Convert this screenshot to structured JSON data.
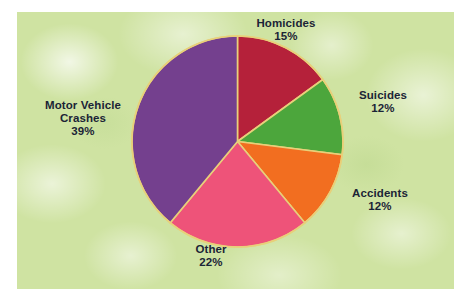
{
  "chart_data": {
    "type": "pie",
    "title": "",
    "subtitle": "",
    "xlabel": "",
    "ylabel": "",
    "legend_position": "none",
    "grid": false,
    "units": "percent",
    "total": 100,
    "categories": [
      "Homicides",
      "Suicides",
      "Accidents",
      "Other",
      "Motor Vehicle Crashes"
    ],
    "values": [
      15,
      12,
      12,
      22,
      39
    ],
    "start_angle_deg": 0,
    "direction": "clockwise",
    "slices": [
      {
        "label": "Homicides",
        "value": 15,
        "value_text": "15%",
        "color": "#b5213a",
        "start_deg": 0,
        "end_deg": 54,
        "label_position": "top-right"
      },
      {
        "label": "Suicides",
        "value": 12,
        "value_text": "12%",
        "color": "#4ca63c",
        "start_deg": 54,
        "end_deg": 97.2,
        "label_position": "right-upper"
      },
      {
        "label": "Accidents",
        "value": 12,
        "value_text": "12%",
        "color": "#f26e20",
        "start_deg": 97.2,
        "end_deg": 140.4,
        "label_position": "right-lower"
      },
      {
        "label": "Other",
        "value": 22,
        "value_text": "22%",
        "color": "#ee5379",
        "start_deg": 140.4,
        "end_deg": 219.6,
        "label_position": "bottom"
      },
      {
        "label": "Motor Vehicle Crashes",
        "value": 39,
        "value_text": "39%",
        "color": "#74408e",
        "start_deg": 219.6,
        "end_deg": 360,
        "label_position": "left"
      }
    ]
  },
  "labels": {
    "homicides": {
      "name": "Homicides",
      "pct": "15%"
    },
    "suicides": {
      "name": "Suicides",
      "pct": "12%"
    },
    "accidents": {
      "name": "Accidents",
      "pct": "12%"
    },
    "other": {
      "name": "Other",
      "pct": "22%"
    },
    "mvc": {
      "name_line1": "Motor Vehicle",
      "name_line2": "Crashes",
      "pct": "39%"
    }
  },
  "style": {
    "panel_background": "#cfe3a2",
    "page_background": "#ffffff",
    "label_text_color": "#1b2436",
    "slice_separator_color": "#e8d07a"
  }
}
